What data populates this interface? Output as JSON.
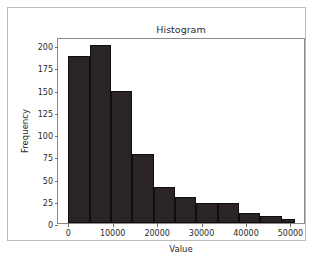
{
  "chart_data": {
    "type": "bar",
    "title": "Histogram",
    "xlabel": "Value",
    "ylabel": "Frequency",
    "xlim": [
      -2300,
      53500
    ],
    "ylim": [
      0,
      209
    ],
    "grid": false,
    "legend": null,
    "bar_color": "#2b2424",
    "edge_color": "#110d0d",
    "xticks": [
      0,
      10000,
      20000,
      30000,
      40000,
      50000
    ],
    "xtick_labels": [
      "0",
      "10000",
      "20000",
      "30000",
      "40000",
      "50000"
    ],
    "yticks": [
      0,
      25,
      50,
      75,
      100,
      125,
      150,
      175,
      200
    ],
    "ytick_labels": [
      "0",
      "25",
      "50",
      "75",
      "100",
      "125",
      "150",
      "175",
      "200"
    ],
    "bin_edges": [
      0,
      4800,
      9600,
      14400,
      19200,
      24000,
      28800,
      33600,
      38400,
      43200,
      48000,
      51000
    ],
    "categories": [
      "0-4800",
      "4800-9600",
      "9600-14400",
      "14400-19200",
      "19200-24000",
      "24000-28800",
      "28800-33600",
      "33600-38400",
      "38400-43200",
      "43200-48000",
      "48000-51000"
    ],
    "values": [
      188,
      200,
      148,
      78,
      41,
      29,
      22,
      22,
      11,
      8,
      4
    ]
  },
  "figure": {
    "background": "#ffffff",
    "frame_color": "#b9b9b9",
    "axes_border_color": "#8a8a8a"
  }
}
